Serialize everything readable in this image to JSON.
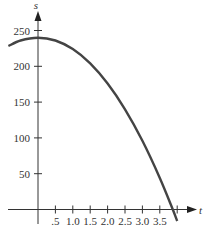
{
  "chart_data": {
    "type": "line",
    "title": "",
    "xlabel": "t",
    "ylabel": "s",
    "xlim": [
      -0.85,
      4.4
    ],
    "ylim": [
      -20,
      270
    ],
    "grid": false,
    "legend": null,
    "x_ticks": [
      0.5,
      1.0,
      1.5,
      2.0,
      2.5,
      3.0,
      3.5,
      4.0
    ],
    "x_tick_labels": [
      ".5",
      "1.0",
      "1.5",
      "2.0",
      "2.5",
      "3.0",
      "3.5",
      ""
    ],
    "y_ticks": [
      50,
      100,
      150,
      200,
      250
    ],
    "y_tick_labels": [
      "50",
      "100",
      "150",
      "200",
      "250"
    ],
    "series": [
      {
        "name": "s = 240 - 16t^2",
        "x": [
          -0.85,
          -0.5,
          0,
          0.5,
          1.0,
          1.5,
          2.0,
          2.5,
          3.0,
          3.5,
          3.87,
          4.0
        ],
        "values": [
          228.4,
          236,
          240,
          236,
          224,
          204,
          176,
          140,
          96,
          44,
          0.4,
          -16
        ]
      }
    ]
  }
}
